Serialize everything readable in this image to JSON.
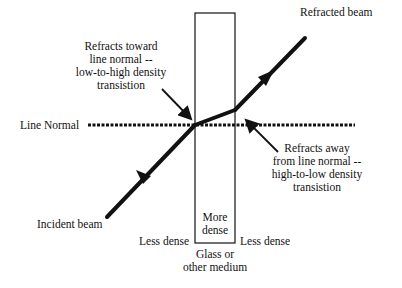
{
  "diagram": {
    "labels": {
      "refracted_beam": "Refracted beam",
      "incident_beam": "Incident beam",
      "line_normal": "Line Normal",
      "toward_normal": [
        "Refracts toward",
        "line normal --",
        "low-to-high density",
        "transistion"
      ],
      "away_normal": [
        "Refracts away",
        "from line normal --",
        "high-to-low density",
        "transistion"
      ],
      "more_dense": [
        "More",
        "dense"
      ],
      "less_dense_left": "Less dense",
      "less_dense_right": "Less dense",
      "medium": [
        "Glass or",
        "other medium"
      ]
    },
    "colors": {
      "ink": "#111111",
      "background": "#ffffff"
    }
  }
}
